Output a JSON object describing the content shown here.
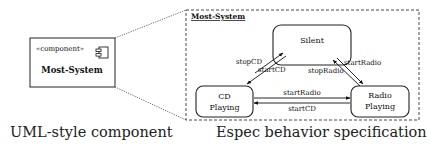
{
  "component": {
    "stereotype": "«component»",
    "name": "Most-System",
    "icon": "component-icon"
  },
  "behavior": {
    "frame_title": "Most-System",
    "states": {
      "silent": "Silent",
      "cd_line1": "CD",
      "cd_line2": "Playing",
      "radio_line1": "Radio",
      "radio_line2": "Playing"
    },
    "transitions": {
      "silent_to_cd": "startCD",
      "cd_to_silent": "stopCD",
      "silent_to_radio": "startRadio",
      "radio_to_silent": "stopRadio",
      "cd_to_radio": "startRadio",
      "radio_to_cd": "startCD"
    }
  },
  "captions": {
    "left": "UML-style component",
    "right": "Espec behavior specification"
  }
}
